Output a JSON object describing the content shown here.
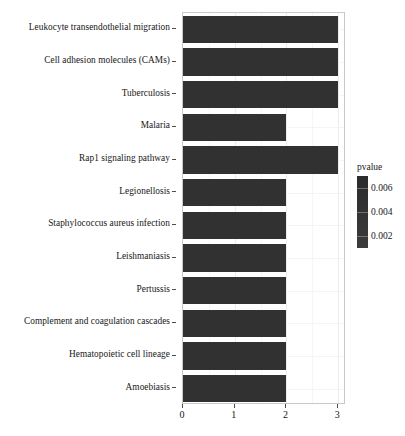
{
  "chart_data": {
    "type": "bar",
    "orientation": "horizontal",
    "title": "",
    "xlabel": "",
    "ylabel": "",
    "xlim": [
      0,
      3.15
    ],
    "xticks": [
      "0",
      "1",
      "2",
      "3"
    ],
    "xtick_values": [
      0,
      1,
      2,
      3
    ],
    "grid": true,
    "legend_position": "right",
    "categories": [
      "Leukocyte transendothelial migration",
      "Cell adhesion molecules (CAMs)",
      "Tuberculosis",
      "Malaria",
      "Rap1 signaling pathway",
      "Legionellosis",
      "Staphylococcus aureus infection",
      "Leishmaniasis",
      "Pertussis",
      "Complement and coagulation cascades",
      "Hematopoietic cell lineage",
      "Amoebiasis"
    ],
    "values": [
      3,
      3,
      3,
      2,
      3,
      2,
      2,
      2,
      2,
      2,
      2,
      2
    ],
    "bar_color": "#313131",
    "legend": {
      "title": "pvalue",
      "ticks": [
        "0.006",
        "0.004",
        "0.002"
      ],
      "tick_values": [
        0.006,
        0.004,
        0.002
      ],
      "gradient_high_color": "#2b2b2b",
      "gradient_low_color": "#3c3c3c"
    }
  },
  "axis": {
    "tick_color": "#4d4d4d",
    "panel_border_color": "#c9c9c9"
  }
}
